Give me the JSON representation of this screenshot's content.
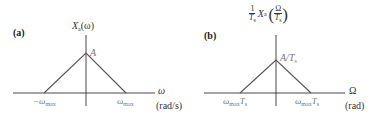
{
  "panels": [
    {
      "label": "(a)",
      "y_axis_label": {
        "base": "X",
        "sub": "a",
        "arg": "(ω)"
      },
      "peak_label": "A",
      "left_tick": {
        "base": "−ω",
        "sub": "max"
      },
      "right_tick": {
        "base": "ω",
        "sub": "max"
      },
      "x_axis_symbol": "ω",
      "x_axis_unit": "(rad/s)"
    },
    {
      "label": "(b)",
      "y_axis_label": {
        "frac_num": "1",
        "frac_den": "T",
        "frac_den_sub": "s",
        "base": "X",
        "sub": "a",
        "arg_num": "Ω",
        "arg_den": "T",
        "arg_den_sub": "s"
      },
      "peak_label": "A/T",
      "peak_label_sub": "s",
      "left_tick": {
        "base": "ω",
        "sub": "max",
        "suffix": "T",
        "suffix_sub": "s"
      },
      "right_tick": {
        "base": "ω",
        "sub": "max",
        "suffix": "T",
        "suffix_sub": "s"
      },
      "x_axis_symbol": "Ω",
      "x_axis_unit": "(rad)"
    }
  ],
  "colors": {
    "axis": "#333333",
    "spectrum": "#555555",
    "label_gray": "#777777"
  }
}
